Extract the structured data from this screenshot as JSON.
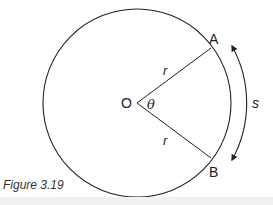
{
  "figure": {
    "caption": "Figure 3.19",
    "center_label": "O",
    "angle_label": "θ",
    "point_a_label": "A",
    "point_b_label": "B",
    "radius_label_upper": "r",
    "radius_label_lower": "r",
    "arc_length_label": "s",
    "stroke_color": "#222222"
  }
}
